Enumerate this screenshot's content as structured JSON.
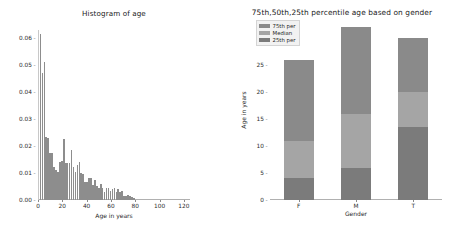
{
  "chart_data": [
    {
      "type": "bar",
      "id": "histogram-age",
      "title": "Histogram of age",
      "xlabel": "Age in years",
      "ylabel": "",
      "xlim": [
        0,
        125
      ],
      "ylim": [
        0,
        0.063
      ],
      "xticks": [
        0,
        20,
        40,
        60,
        80,
        100,
        120
      ],
      "xticklabels": [
        "0",
        "20",
        "40",
        "60",
        "80",
        "100",
        "120"
      ],
      "yticks": [
        0.0,
        0.01,
        0.02,
        0.03,
        0.04,
        0.05,
        0.06
      ],
      "yticklabels": [
        "0.00",
        "0.01",
        "0.02",
        "0.03",
        "0.04",
        "0.05",
        "0.06"
      ],
      "grid": false,
      "bar_color": "#8d8d8d",
      "bin_width": 1.6,
      "x": [
        2.0,
        3.6,
        5.2,
        6.8,
        8.4,
        10.0,
        11.6,
        13.2,
        14.8,
        16.4,
        18.0,
        19.6,
        21.2,
        22.8,
        24.4,
        26.0,
        27.6,
        29.2,
        30.8,
        32.4,
        34.0,
        35.6,
        37.2,
        38.8,
        40.4,
        42.0,
        43.6,
        45.2,
        46.8,
        48.4,
        50.0,
        51.6,
        53.2,
        54.8,
        56.4,
        58.0,
        59.6,
        61.2,
        62.8,
        64.4,
        66.0,
        67.6,
        69.2,
        70.8,
        72.4,
        74.0,
        75.6,
        77.2,
        78.8
      ],
      "values": [
        0.0615,
        0.0472,
        0.0512,
        0.0233,
        0.0228,
        0.0174,
        0.0174,
        0.0122,
        0.011,
        0.0104,
        0.0141,
        0.0145,
        0.0225,
        0.0137,
        0.0138,
        0.0139,
        0.0184,
        0.0122,
        0.0103,
        0.0129,
        0.014,
        0.0099,
        0.0097,
        0.0066,
        0.0066,
        0.0083,
        0.008,
        0.0056,
        0.0075,
        0.0051,
        0.0043,
        0.0058,
        0.0044,
        0.0028,
        0.0045,
        0.0046,
        0.0034,
        0.0042,
        0.0045,
        0.0029,
        0.0041,
        0.003,
        0.0035,
        0.0016,
        0.0014,
        0.0018,
        0.0016,
        0.0011,
        0.0009
      ]
    },
    {
      "type": "bar",
      "id": "percentile-age-by-gender",
      "title": "75th,50th,25th percentile age based on gender",
      "xlabel": "Gender",
      "ylabel": "Age in years",
      "categories": [
        "F",
        "M",
        "T"
      ],
      "ylim": [
        0,
        33
      ],
      "yticks": [
        0,
        5,
        10,
        15,
        20,
        25,
        30
      ],
      "yticklabels": [
        "0",
        "5",
        "10",
        "15",
        "20",
        "25",
        "30"
      ],
      "grid": false,
      "legend_position": "upper-left",
      "series": [
        {
          "name": "75th per",
          "color": "#8a8a8a",
          "values": [
            26,
            32,
            30
          ]
        },
        {
          "name": "Median",
          "color": "#a5a5a5",
          "values": [
            11,
            16,
            20
          ]
        },
        {
          "name": "25th per",
          "color": "#7b7b7b",
          "values": [
            4,
            6,
            13.5
          ]
        }
      ]
    }
  ]
}
